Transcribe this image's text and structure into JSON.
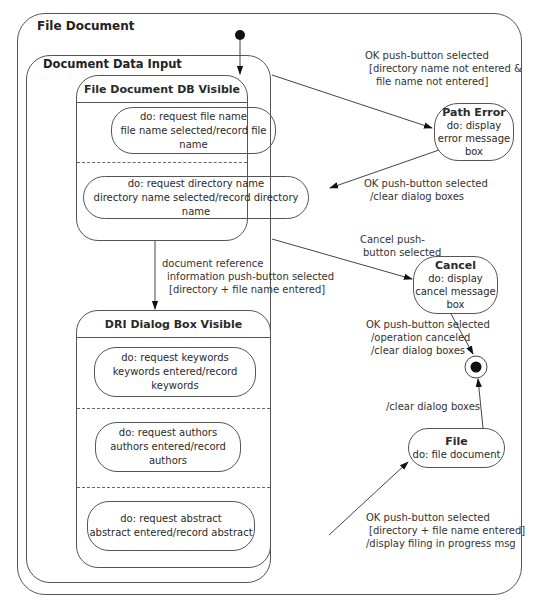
{
  "diagram": {
    "outer_state": {
      "title": "File Document"
    },
    "composite_state": {
      "title": "Document Data Input"
    },
    "file_db_state": {
      "title": "File Document DB Visible",
      "regions": [
        {
          "line1": "do: request file name",
          "line2": "file name selected/record file name"
        },
        {
          "line1": "do: request directory name",
          "line2": "directory name selected/record directory name"
        }
      ]
    },
    "dri_state": {
      "title": "DRI Dialog Box Visible",
      "regions": [
        {
          "line1": "do: request keywords",
          "line2": "keywords entered/record keywords"
        },
        {
          "line1": "do: request authors",
          "line2": "authors entered/record authors"
        },
        {
          "line1": "do: request abstract",
          "line2": "abstract entered/record abstract"
        }
      ]
    },
    "path_error_state": {
      "title": "Path Error",
      "lines": [
        "do: display",
        "error message",
        "box"
      ]
    },
    "cancel_state": {
      "title": "Cancel",
      "lines": [
        "do: display",
        "cancel message",
        "box"
      ]
    },
    "file_state": {
      "title": "File",
      "lines": [
        "do: file document"
      ]
    },
    "transitions": {
      "to_path_error": [
        "OK push-button selected",
        "[directory name not entered &",
        "file name not entered]"
      ],
      "from_path_error": [
        "OK push-button selected",
        "/clear dialog boxes"
      ],
      "to_dri": [
        "document reference",
        "information push-button selected",
        "[directory + file name entered]"
      ],
      "to_cancel": [
        "Cancel push-",
        "button selected"
      ],
      "cancel_to_final": [
        "OK push-button selected",
        "/operation canceled",
        "/clear dialog boxes"
      ],
      "file_to_final": [
        "/clear dialog boxes"
      ],
      "to_file": [
        "OK push-button selected",
        "[directory + file name entered]",
        "/display filing in progress msg"
      ]
    }
  }
}
